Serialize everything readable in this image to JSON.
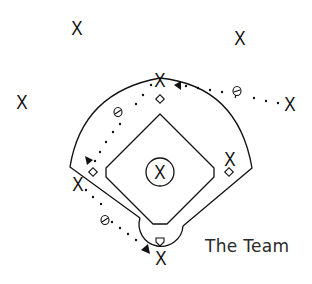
{
  "diagram": {
    "title": "The Team",
    "colors": {
      "ink": "#111111",
      "background": "#ffffff"
    },
    "players": [
      {
        "id": "left-outfield",
        "label": "X",
        "x": 77,
        "y": 28
      },
      {
        "id": "right-outfield",
        "label": "X",
        "x": 240,
        "y": 38
      },
      {
        "id": "far-left",
        "label": "X",
        "x": 22,
        "y": 102
      },
      {
        "id": "far-right",
        "label": "X",
        "x": 290,
        "y": 104
      },
      {
        "id": "second-base",
        "label": "X",
        "x": 160,
        "y": 80
      },
      {
        "id": "first-base",
        "label": "X",
        "x": 230,
        "y": 159
      },
      {
        "id": "third-base",
        "label": "X",
        "x": 78,
        "y": 184
      },
      {
        "id": "pitcher",
        "label": "X",
        "x": 160,
        "y": 172
      },
      {
        "id": "catcher",
        "label": "X",
        "x": 161,
        "y": 258
      }
    ],
    "bases": [
      {
        "id": "second",
        "shape": "diamond",
        "x": 160,
        "y": 99
      },
      {
        "id": "first",
        "shape": "diamond",
        "x": 229,
        "y": 172
      },
      {
        "id": "third",
        "shape": "diamond",
        "x": 93,
        "y": 172
      },
      {
        "id": "home",
        "shape": "home-plate",
        "x": 160,
        "y": 242
      }
    ],
    "ball_paths": [
      {
        "from": "far-right",
        "to": "second-base",
        "style": "dotted",
        "arrow": true
      },
      {
        "from": "second-base",
        "to": "third-base",
        "style": "dotted",
        "arrow": true
      },
      {
        "from": "third-base",
        "to": "catcher",
        "style": "dotted",
        "arrow": true
      }
    ],
    "ball_glyphs": [
      {
        "x": 237,
        "y": 92
      },
      {
        "x": 119,
        "y": 112
      },
      {
        "x": 105,
        "y": 220
      }
    ]
  }
}
